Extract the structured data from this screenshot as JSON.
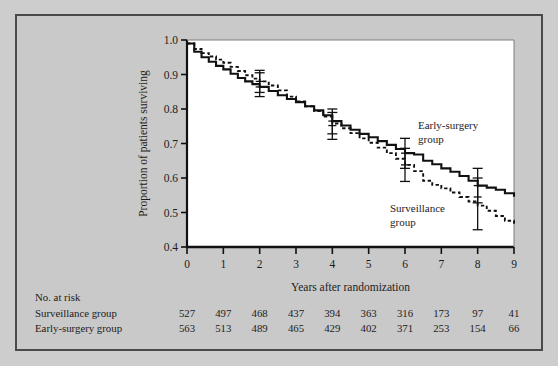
{
  "chart_data": {
    "type": "line",
    "title": "",
    "xlabel": "Years  after randomization",
    "ylabel": "Proportion of patients surviving",
    "xlim": [
      0,
      9
    ],
    "ylim": [
      0.4,
      1.0
    ],
    "xticks": [
      "0",
      "1",
      "2",
      "3",
      "4",
      "5",
      "6",
      "7",
      "8",
      "9"
    ],
    "yticks": [
      "1.0",
      "0.9",
      "0.8",
      "0.7",
      "0.6",
      "0.5",
      "0.4"
    ],
    "grid": false,
    "legend_position": "inline-annotation",
    "series": [
      {
        "name": "Early-surgery group",
        "style": "solid",
        "color": "#111111",
        "label_line1": "Early-surgery",
        "label_line2": "group",
        "x": [
          0,
          0.2,
          0.4,
          0.6,
          0.8,
          1.0,
          1.2,
          1.4,
          1.6,
          1.8,
          2.0,
          2.25,
          2.5,
          2.75,
          3.0,
          3.25,
          3.5,
          3.75,
          4.0,
          4.25,
          4.5,
          4.75,
          5.0,
          5.25,
          5.5,
          5.75,
          6.0,
          6.25,
          6.5,
          6.75,
          7.0,
          7.25,
          7.5,
          7.75,
          8.0,
          8.25,
          8.5,
          8.75,
          9.0
        ],
        "y": [
          0.99,
          0.966,
          0.95,
          0.937,
          0.925,
          0.915,
          0.902,
          0.89,
          0.88,
          0.872,
          0.864,
          0.852,
          0.84,
          0.829,
          0.82,
          0.808,
          0.796,
          0.782,
          0.765,
          0.752,
          0.74,
          0.728,
          0.718,
          0.707,
          0.696,
          0.684,
          0.672,
          0.668,
          0.65,
          0.64,
          0.628,
          0.618,
          0.606,
          0.592,
          0.578,
          0.572,
          0.566,
          0.556,
          0.546
        ]
      },
      {
        "name": "Surveillance group",
        "style": "dashed",
        "color": "#111111",
        "label_line1": "Surveillance",
        "label_line2": "group",
        "x": [
          0,
          0.2,
          0.4,
          0.6,
          0.8,
          1.0,
          1.2,
          1.4,
          1.6,
          1.8,
          2.0,
          2.25,
          2.5,
          2.75,
          3.0,
          3.25,
          3.5,
          3.75,
          4.0,
          4.25,
          4.5,
          4.75,
          5.0,
          5.25,
          5.5,
          5.75,
          6.0,
          6.25,
          6.5,
          6.75,
          7.0,
          7.25,
          7.5,
          7.75,
          8.0,
          8.25,
          8.5,
          8.75,
          9.0
        ],
        "y": [
          0.99,
          0.974,
          0.962,
          0.952,
          0.943,
          0.934,
          0.922,
          0.91,
          0.898,
          0.888,
          0.88,
          0.868,
          0.854,
          0.836,
          0.822,
          0.808,
          0.794,
          0.778,
          0.758,
          0.744,
          0.73,
          0.715,
          0.702,
          0.688,
          0.672,
          0.656,
          0.638,
          0.62,
          0.592,
          0.58,
          0.57,
          0.558,
          0.545,
          0.532,
          0.52,
          0.505,
          0.49,
          0.476,
          0.465
        ]
      }
    ],
    "error_bars": [
      {
        "series": "Early-surgery group",
        "x": 2,
        "y": 0.864,
        "lower": 0.836,
        "upper": 0.905
      },
      {
        "series": "Surveillance group",
        "x": 2,
        "y": 0.88,
        "lower": 0.848,
        "upper": 0.912
      },
      {
        "series": "Early-surgery group",
        "x": 4,
        "y": 0.765,
        "lower": 0.728,
        "upper": 0.8
      },
      {
        "series": "Surveillance group",
        "x": 4,
        "y": 0.752,
        "lower": 0.712,
        "upper": 0.79
      },
      {
        "series": "Early-surgery group",
        "x": 6,
        "y": 0.672,
        "lower": 0.628,
        "upper": 0.715
      },
      {
        "series": "Surveillance group",
        "x": 6,
        "y": 0.638,
        "lower": 0.59,
        "upper": 0.686
      },
      {
        "series": "Early-surgery group",
        "x": 8,
        "y": 0.578,
        "lower": 0.528,
        "upper": 0.628
      },
      {
        "series": "Surveillance group",
        "x": 8,
        "y": 0.545,
        "lower": 0.45,
        "upper": 0.6
      }
    ]
  },
  "risk_table": {
    "heading": "No. at risk",
    "rows": [
      {
        "label": "Surveillance group",
        "values": [
          "527",
          "497",
          "468",
          "437",
          "394",
          "363",
          "316",
          "173",
          "97",
          "41"
        ]
      },
      {
        "label": "Early-surgery group",
        "values": [
          "563",
          "513",
          "489",
          "465",
          "429",
          "402",
          "371",
          "253",
          "154",
          "66"
        ]
      }
    ]
  },
  "colors": {
    "background": "#c9c9c9",
    "plot_background": "#ffffff",
    "ink": "#111111",
    "frame": "#4a4a4a"
  }
}
